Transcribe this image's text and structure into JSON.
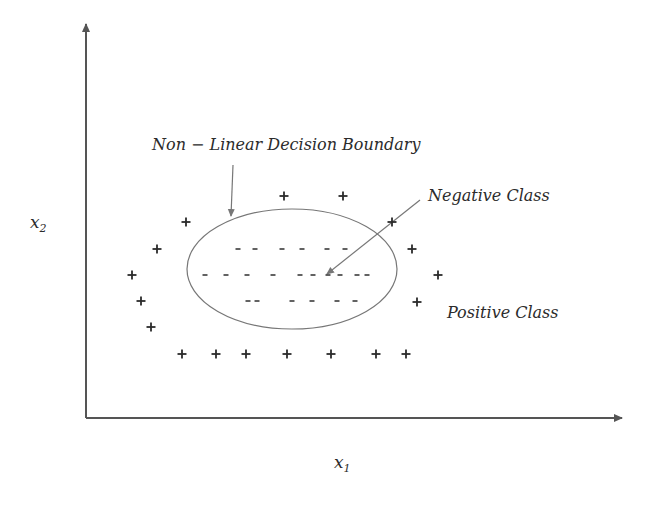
{
  "diagram": {
    "labels": {
      "boundary": "Non − Linear Decision Boundary",
      "negative": "Negative Class",
      "positive": "Positive Class",
      "x_axis": "x",
      "x_axis_sub": "1",
      "y_axis": "x",
      "y_axis_sub": "2"
    },
    "axes": {
      "origin": [
        86,
        418
      ],
      "x_end": [
        622,
        418
      ],
      "y_end": [
        86,
        24
      ]
    },
    "ellipse": {
      "cx": 292,
      "cy": 269,
      "rx": 105,
      "ry": 60
    },
    "arrows": [
      {
        "name": "boundary-pointer",
        "from": [
          233,
          165
        ],
        "to": [
          231,
          216
        ]
      },
      {
        "name": "negative-pointer",
        "from": [
          420,
          200
        ],
        "to": [
          327,
          274
        ]
      }
    ],
    "positive_points": [
      [
        284,
        196
      ],
      [
        343,
        196
      ],
      [
        186,
        222
      ],
      [
        392,
        222
      ],
      [
        157,
        249
      ],
      [
        412,
        249
      ],
      [
        132,
        275
      ],
      [
        438,
        275
      ],
      [
        141,
        301
      ],
      [
        417,
        302
      ],
      [
        151,
        327
      ],
      [
        182,
        354
      ],
      [
        216,
        354
      ],
      [
        246,
        354
      ],
      [
        287,
        354
      ],
      [
        331,
        354
      ],
      [
        376,
        354
      ],
      [
        406,
        354
      ]
    ],
    "negative_points": [
      [
        238,
        249
      ],
      [
        255,
        249
      ],
      [
        282,
        249
      ],
      [
        302,
        249
      ],
      [
        327,
        249
      ],
      [
        345,
        249
      ],
      [
        205,
        275
      ],
      [
        226,
        275
      ],
      [
        247,
        275
      ],
      [
        273,
        275
      ],
      [
        300,
        275
      ],
      [
        313,
        275
      ],
      [
        328,
        275
      ],
      [
        340,
        275
      ],
      [
        357,
        275
      ],
      [
        367,
        275
      ],
      [
        248,
        301
      ],
      [
        257,
        301
      ],
      [
        292,
        301
      ],
      [
        312,
        301
      ],
      [
        337,
        301
      ],
      [
        355,
        301
      ]
    ],
    "colors": {
      "ink": "#2b2b2b",
      "axis": "#555555",
      "boundary": "#777777",
      "background": "#ffffff"
    }
  }
}
